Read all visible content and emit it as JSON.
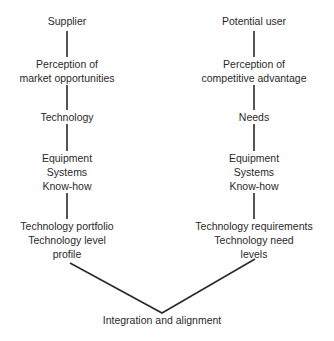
{
  "left_column": {
    "supplier": "Supplier",
    "perception": [
      "Perception of",
      "market opportunities"
    ],
    "technology": "Technology",
    "assets": [
      "Equipment",
      "Systems",
      "Know-how"
    ],
    "outcome": [
      "Technology portfolio",
      "Technology level",
      "profile"
    ]
  },
  "right_column": {
    "user": "Potential user",
    "perception": [
      "Perception of",
      "competitive advantage"
    ],
    "needs": "Needs",
    "assets": [
      "Equipment",
      "Systems",
      "Know-how"
    ],
    "outcome": [
      "Technology requirements",
      "Technology need",
      "levels"
    ]
  },
  "convergence": "Integration and alignment",
  "line_color": "#2a2a2a"
}
